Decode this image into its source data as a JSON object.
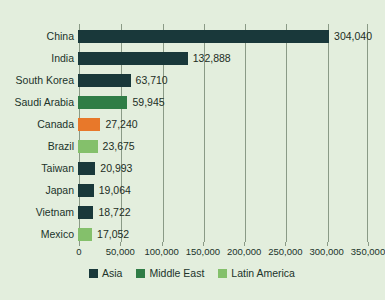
{
  "chart_data": {
    "type": "bar",
    "orientation": "horizontal",
    "title": "",
    "xlabel": "",
    "ylabel": "",
    "categories": [
      "China",
      "India",
      "South Korea",
      "Saudi Arabia",
      "Canada",
      "Brazil",
      "Taiwan",
      "Japan",
      "Vietnam",
      "Mexico"
    ],
    "values": [
      304040,
      132888,
      63710,
      59945,
      27240,
      23675,
      20993,
      19064,
      18722,
      17052
    ],
    "value_labels": [
      "304,040",
      "132,888",
      "63,710",
      "59,945",
      "27,240",
      "23,675",
      "20,993",
      "19,064",
      "18,722",
      "17,052"
    ],
    "bar_groups": [
      "Asia",
      "Asia",
      "Asia",
      "Middle East",
      "Canada",
      "Latin America",
      "Asia",
      "Asia",
      "Asia",
      "Latin America"
    ],
    "bar_colors": [
      "#19383a",
      "#19383a",
      "#19383a",
      "#2f7d46",
      "#e8782a",
      "#84c06b",
      "#19383a",
      "#19383a",
      "#19383a",
      "#84c06b"
    ],
    "xlim": [
      0,
      350000
    ],
    "xticks": [
      0,
      50000,
      100000,
      150000,
      200000,
      250000,
      300000,
      350000
    ],
    "xtick_labels": [
      "0",
      "50,000",
      "100,000",
      "150,000",
      "200,000",
      "250,000",
      "300,000",
      "350,000"
    ],
    "grid": true,
    "grid_axis": "x",
    "legend_position": "bottom",
    "legend": [
      {
        "label": "Asia",
        "color": "#19383a"
      },
      {
        "label": "Middle East",
        "color": "#2f7d46"
      },
      {
        "label": "Latin America",
        "color": "#84c06b"
      }
    ],
    "background_color": "#e3eedd",
    "axis_color": "#8a9a86",
    "text_color": "#20332a"
  }
}
